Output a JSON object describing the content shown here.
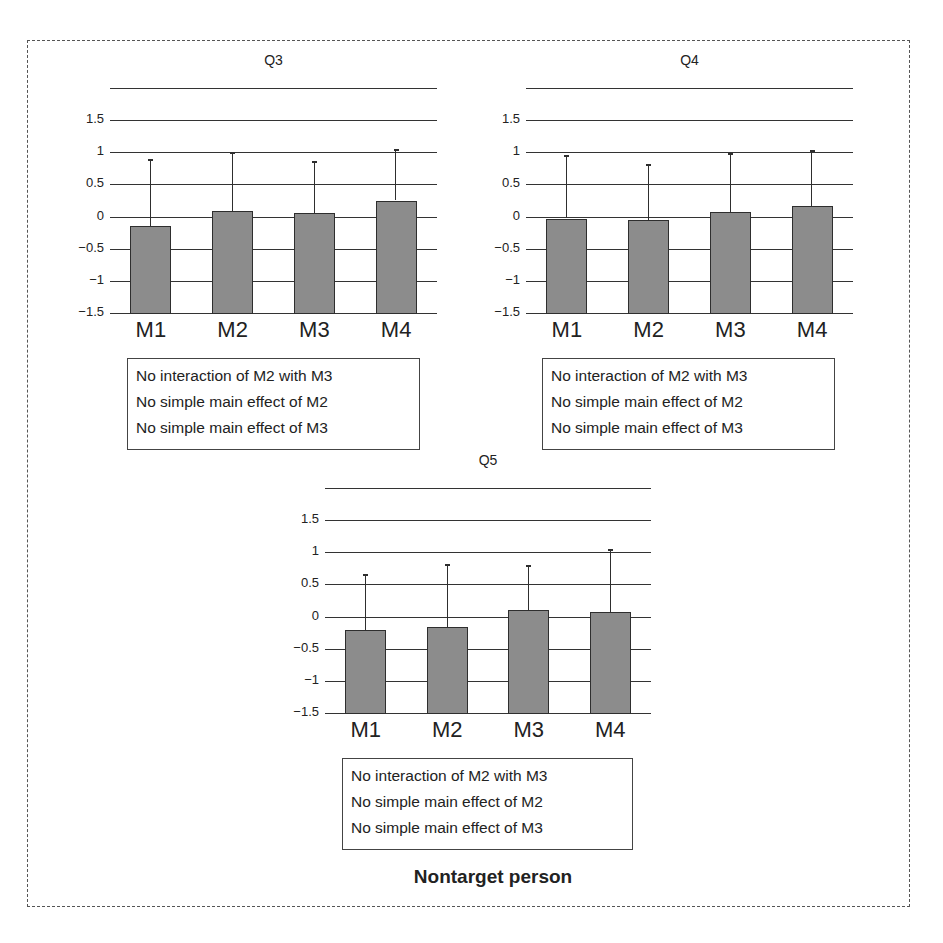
{
  "caption": "Nontarget person",
  "colors": {
    "bar_fill": "#8c8c8c",
    "bar_border": "#2e2e2e",
    "grid": "#333333",
    "frame": "#555555"
  },
  "chart_data": [
    {
      "type": "bar",
      "title": "Q3",
      "categories": [
        "M1",
        "M2",
        "M3",
        "M4"
      ],
      "values": [
        -0.15,
        0.08,
        0.05,
        0.25
      ],
      "error_upper": [
        0.89,
        1.0,
        0.86,
        1.05
      ],
      "yticks": [
        "1.5",
        "1",
        "0.5",
        "0",
        "−0.5",
        "−1",
        "−1.5"
      ],
      "ylim": [
        -1.5,
        2.0
      ],
      "grid": true,
      "notes": [
        "No interaction of M2 with M3",
        "No simple main effect of M2",
        "No simple main effect of M3"
      ]
    },
    {
      "type": "bar",
      "title": "Q4",
      "categories": [
        "M1",
        "M2",
        "M3",
        "M4"
      ],
      "values": [
        -0.03,
        -0.06,
        0.07,
        0.17
      ],
      "error_upper": [
        0.96,
        0.82,
        0.99,
        1.03
      ],
      "yticks": [
        "1.5",
        "1",
        "0.5",
        "0",
        "−0.5",
        "−1",
        "−1.5"
      ],
      "ylim": [
        -1.5,
        2.0
      ],
      "grid": true,
      "notes": [
        "No interaction of M2 with M3",
        "No simple main effect of M2",
        "No simple main effect of M3"
      ]
    },
    {
      "type": "bar",
      "title": "Q5",
      "categories": [
        "M1",
        "M2",
        "M3",
        "M4"
      ],
      "values": [
        -0.21,
        -0.16,
        0.1,
        0.07
      ],
      "error_upper": [
        0.67,
        0.82,
        0.81,
        1.05
      ],
      "yticks": [
        "1.5",
        "1",
        "0.5",
        "0",
        "−0.5",
        "−1",
        "−1.5"
      ],
      "ylim": [
        -1.5,
        2.0
      ],
      "grid": true,
      "notes": [
        "No interaction of M2 with M3",
        "No simple main effect of M2",
        "No simple main effect of M3"
      ]
    }
  ]
}
